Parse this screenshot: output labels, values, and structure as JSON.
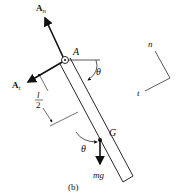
{
  "figure": {
    "caption": "(b)",
    "labels": {
      "An_main": "A",
      "An_sub": "n",
      "At_main": "A",
      "At_sub": "t",
      "pin": "A",
      "theta_top": "θ",
      "center_of_mass": "G",
      "half_length_num": "l",
      "half_length_den": "2",
      "theta_bottom": "θ",
      "weight": "mg",
      "axis_n": "n",
      "axis_t": "t"
    },
    "colors": {
      "ink": "#111111",
      "background": "#ffffff"
    }
  }
}
